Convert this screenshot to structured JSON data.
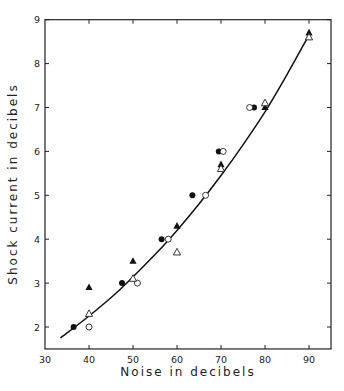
{
  "chart_data": {
    "type": "scatter",
    "title": "",
    "xlabel": "Noise in decibels",
    "ylabel": "Shock current in decibels",
    "xlim": [
      30,
      95
    ],
    "ylim": [
      1.5,
      9
    ],
    "x_ticks": [
      30,
      40,
      50,
      60,
      70,
      80,
      90
    ],
    "y_ticks": [
      2,
      3,
      4,
      5,
      6,
      7,
      8,
      9
    ],
    "grid": false,
    "legend": null,
    "series": [
      {
        "name": "filled circles",
        "marker": "filled-circle",
        "points": [
          [
            36.5,
            2.0
          ],
          [
            47.5,
            3.0
          ],
          [
            56.5,
            4.0
          ],
          [
            63.5,
            5.0
          ],
          [
            69.5,
            6.0
          ],
          [
            77.5,
            7.0
          ]
        ]
      },
      {
        "name": "open circles",
        "marker": "open-circle",
        "points": [
          [
            40,
            2.0
          ],
          [
            51,
            3.0
          ],
          [
            58,
            4.0
          ],
          [
            66.5,
            5.0
          ],
          [
            70.5,
            6.0
          ],
          [
            76.5,
            7.0
          ]
        ]
      },
      {
        "name": "filled triangles",
        "marker": "filled-triangle",
        "points": [
          [
            40,
            2.9
          ],
          [
            50,
            3.5
          ],
          [
            60,
            4.3
          ],
          [
            70,
            5.7
          ],
          [
            80,
            7.0
          ],
          [
            90,
            8.7
          ]
        ]
      },
      {
        "name": "open triangles",
        "marker": "open-triangle",
        "points": [
          [
            40,
            2.3
          ],
          [
            50,
            3.1
          ],
          [
            60,
            3.7
          ],
          [
            70,
            5.6
          ],
          [
            80,
            7.1
          ],
          [
            90,
            8.6
          ]
        ]
      },
      {
        "name": "fitted curve",
        "type": "line",
        "points": [
          [
            33.5,
            1.75
          ],
          [
            40,
            2.25
          ],
          [
            47,
            2.85
          ],
          [
            55,
            3.65
          ],
          [
            60,
            4.2
          ],
          [
            65,
            4.8
          ],
          [
            70,
            5.45
          ],
          [
            75,
            6.15
          ],
          [
            80,
            6.9
          ],
          [
            85,
            7.75
          ],
          [
            90,
            8.65
          ]
        ]
      }
    ]
  }
}
